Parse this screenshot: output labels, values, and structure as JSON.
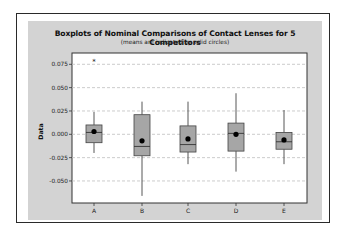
{
  "chart_data": {
    "type": "boxplot",
    "title": "Boxplots of Nominal Comparisons of Contact Lenses for 5 Competitors",
    "subtitle": "(means are indicated by solid circles)",
    "xlabel": "",
    "ylabel": "Data",
    "ylim": [
      -0.07,
      0.082
    ],
    "yticks": [
      0.075,
      0.05,
      0.025,
      0.0,
      -0.025,
      -0.05
    ],
    "ytick_labels": [
      "0.075",
      "0.050",
      "0.025",
      "0.000",
      "-0.025",
      "-0.050"
    ],
    "grid": "horizontal dashed",
    "legend": null,
    "categories": [
      "A",
      "B",
      "C",
      "D",
      "E"
    ],
    "boxes": [
      {
        "name": "A",
        "whisker_low": -0.02,
        "q1": -0.009,
        "median": 0.002,
        "q3": 0.01,
        "whisker_high": 0.024,
        "mean": 0.003,
        "outliers": [
          0.078
        ]
      },
      {
        "name": "B",
        "whisker_low": -0.066,
        "q1": -0.023,
        "median": -0.013,
        "q3": 0.021,
        "whisker_high": 0.035,
        "mean": -0.007,
        "outliers": []
      },
      {
        "name": "C",
        "whisker_low": -0.032,
        "q1": -0.019,
        "median": -0.011,
        "q3": 0.009,
        "whisker_high": 0.035,
        "mean": -0.005,
        "outliers": []
      },
      {
        "name": "D",
        "whisker_low": -0.04,
        "q1": -0.018,
        "median": 0.001,
        "q3": 0.012,
        "whisker_high": 0.044,
        "mean": 0.0,
        "outliers": []
      },
      {
        "name": "E",
        "whisker_low": -0.032,
        "q1": -0.016,
        "median": -0.008,
        "q3": 0.002,
        "whisker_high": 0.026,
        "mean": -0.006,
        "outliers": []
      }
    ],
    "colors": {
      "box_fill": "#a6a6a6",
      "box_edge": "#444444",
      "panel": "#d3d3d3",
      "plot_bg": "#ffffff",
      "grid": "#bfbfbf",
      "mean_dot": "#000000"
    }
  }
}
